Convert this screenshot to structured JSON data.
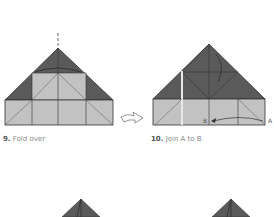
{
  "steps": [
    {
      "number": "9.",
      "text": "Fold over"
    },
    {
      "number": "10.",
      "text": "Join A to B"
    }
  ],
  "labels": {
    "a": "A",
    "b": "B"
  },
  "icons": {
    "turn_over": "turn-over-arrow-icon"
  },
  "colors": {
    "dark_paper": "#5a5a5a",
    "light_paper": "#c2c2c2",
    "line": "#333333",
    "caption": "#888888"
  }
}
